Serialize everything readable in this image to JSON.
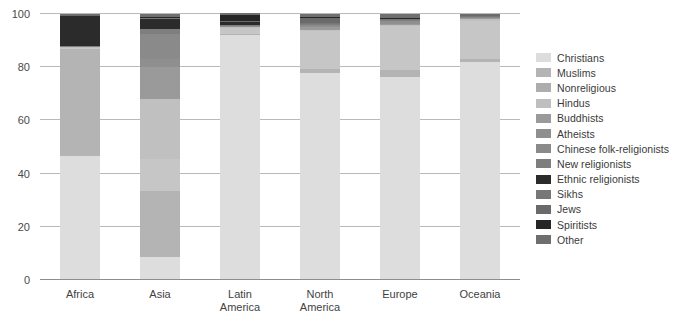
{
  "chart_data": {
    "type": "bar",
    "stacked": true,
    "title": "",
    "xlabel": "",
    "ylabel": "",
    "ylim": [
      0,
      100
    ],
    "yticks": [
      0,
      20,
      40,
      60,
      80,
      100
    ],
    "ytick_labels": [
      "0",
      "20",
      "40",
      "60",
      "80",
      "100"
    ],
    "grid": true,
    "legend_position": "right",
    "categories": [
      "Africa",
      "Asia",
      "Latin\nAmerica",
      "North\nAmerica",
      "Europe",
      "Oceania"
    ],
    "category_labels": [
      [
        "Africa"
      ],
      [
        "Asia"
      ],
      [
        "Latin",
        "America"
      ],
      [
        "North",
        "America"
      ],
      [
        "Europe"
      ],
      [
        "Oceania"
      ]
    ],
    "series": [
      {
        "name": "Christians",
        "color": "#dddddd",
        "values": [
          46.5,
          8.5,
          92.0,
          78.0,
          76.5,
          82.0
        ]
      },
      {
        "name": "Muslims",
        "color": "#b4b4b4",
        "values": [
          40.5,
          25.0,
          0.3,
          1.5,
          2.5,
          1.0
        ]
      },
      {
        "name": "Nonreligious",
        "color": "#c6c6c6",
        "values": [
          0.5,
          12.0,
          2.6,
          14.0,
          16.5,
          14.5
        ]
      },
      {
        "name": "Hindus",
        "color": "#c0c0c0",
        "values": [
          0.2,
          22.5,
          0.2,
          0.6,
          0.3,
          0.5
        ]
      },
      {
        "name": "Buddhists",
        "color": "#9a9a9a",
        "values": [
          0.1,
          12.0,
          0.2,
          0.9,
          0.3,
          0.4
        ]
      },
      {
        "name": "Atheists",
        "color": "#8f8f8f",
        "values": [
          0.1,
          3.0,
          0.4,
          0.5,
          1.5,
          0.4
        ]
      },
      {
        "name": "Chinese folk-religionists",
        "color": "#8a8a8a",
        "values": [
          0.0,
          9.5,
          0.1,
          0.2,
          0.05,
          0.1
        ]
      },
      {
        "name": "New religionists",
        "color": "#7e7e7e",
        "values": [
          0.05,
          2.0,
          0.1,
          0.4,
          0.1,
          0.1
        ]
      },
      {
        "name": "Ethnic religionists",
        "color": "#2b2b2b",
        "values": [
          11.5,
          3.5,
          1.2,
          0.4,
          0.1,
          0.2
        ]
      },
      {
        "name": "Sikhs",
        "color": "#777777",
        "values": [
          0.0,
          0.6,
          0.0,
          0.1,
          0.1,
          0.1
        ]
      },
      {
        "name": "Jews",
        "color": "#6a6a6a",
        "values": [
          0.02,
          0.1,
          0.3,
          2.0,
          0.4,
          0.3
        ]
      },
      {
        "name": "Spiritists",
        "color": "#262626",
        "values": [
          0.0,
          0.05,
          2.4,
          0.4,
          0.05,
          0.05
        ]
      },
      {
        "name": "Other",
        "color": "#6f6f6f",
        "values": [
          0.5,
          1.25,
          0.6,
          1.0,
          1.6,
          0.35
        ]
      }
    ]
  },
  "legend": {
    "items": [
      {
        "label": "Christians",
        "color": "#dddddd"
      },
      {
        "label": "Muslims",
        "color": "#b4b4b4"
      },
      {
        "label": "Nonreligious",
        "color": "#adadad"
      },
      {
        "label": "Hindus",
        "color": "#bfbfbf"
      },
      {
        "label": "Buddhists",
        "color": "#9a9a9a"
      },
      {
        "label": "Atheists",
        "color": "#8f8f8f"
      },
      {
        "label": "Chinese folk-religionists",
        "color": "#8a8a8a"
      },
      {
        "label": "New religionists",
        "color": "#7e7e7e"
      },
      {
        "label": "Ethnic religionists",
        "color": "#2b2b2b"
      },
      {
        "label": "Sikhs",
        "color": "#777777"
      },
      {
        "label": "Jews",
        "color": "#6a6a6a"
      },
      {
        "label": "Spiritists",
        "color": "#262626"
      },
      {
        "label": "Other",
        "color": "#6f6f6f"
      }
    ]
  },
  "axes": {
    "y_tick_labels": [
      "100",
      "80",
      "60",
      "40",
      "20",
      "0"
    ]
  }
}
